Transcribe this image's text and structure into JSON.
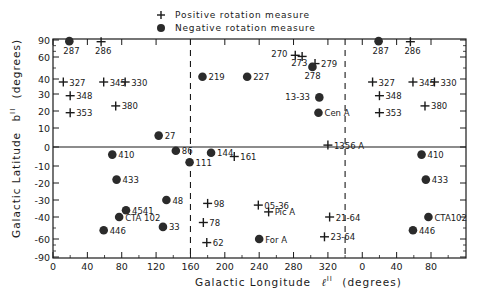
{
  "chart_data": {
    "type": "scatter",
    "title": "",
    "xlabel": "Galactic Longitude ℓII (degrees)",
    "ylabel": "Galactic Latitude bII (degrees)",
    "x_tick_labels": [
      "0",
      "40",
      "80",
      "120",
      "160",
      "200",
      "240",
      "280",
      "320",
      "0",
      "40",
      "80"
    ],
    "x_tick_values_unwrapped": [
      0,
      40,
      80,
      120,
      160,
      200,
      240,
      280,
      320,
      360,
      400,
      440
    ],
    "y_tick_labels": [
      "90",
      "60",
      "40",
      "30",
      "20",
      "10",
      "0",
      "-10",
      "-20",
      "-30",
      "-40",
      "-60",
      "-90"
    ],
    "y_tick_values": [
      90,
      60,
      40,
      30,
      20,
      10,
      0,
      -10,
      -20,
      -30,
      -40,
      -60,
      -90
    ],
    "xlim_unwrapped": [
      0,
      480
    ],
    "ylim": [
      -90,
      90
    ],
    "grid": false,
    "reference_lines": {
      "horizontal": [
        0
      ],
      "vertical_dashed": [
        160,
        340
      ]
    },
    "legend": {
      "position": "top-center",
      "entries": [
        {
          "marker": "plus",
          "label": "Positive rotation measure"
        },
        {
          "marker": "filled-circle",
          "label": "Negative rotation measure"
        }
      ]
    },
    "series": [
      {
        "name": "Positive rotation measure",
        "marker": "plus",
        "points": [
          {
            "label": "286",
            "l": 56,
            "b": 87
          },
          {
            "label": "327",
            "l": 12,
            "b": 38
          },
          {
            "label": "345",
            "l": 59,
            "b": 38
          },
          {
            "label": "330",
            "l": 84,
            "b": 38
          },
          {
            "label": "348",
            "l": 20,
            "b": 29
          },
          {
            "label": "380",
            "l": 73,
            "b": 23
          },
          {
            "label": "353",
            "l": 20,
            "b": 19
          },
          {
            "label": "270",
            "l": 282,
            "b": 63
          },
          {
            "label": "273",
            "l": 290,
            "b": 61
          },
          {
            "label": "279",
            "l": 305,
            "b": 54
          },
          {
            "label": "1356 A",
            "l": 320,
            "b": 1
          },
          {
            "label": "161",
            "l": 211,
            "b": -5
          },
          {
            "label": "98",
            "l": 180,
            "b": -32
          },
          {
            "label": "78",
            "l": 175,
            "b": -45
          },
          {
            "label": "62",
            "l": 179,
            "b": -66
          },
          {
            "label": "05-36",
            "l": 239,
            "b": -33
          },
          {
            "label": "Pic A",
            "l": 251,
            "b": -37
          },
          {
            "label": "21-64",
            "l": 322,
            "b": -40
          },
          {
            "label": "23-64",
            "l": 316,
            "b": -58
          },
          {
            "label": "327",
            "l": 372,
            "b": 38
          },
          {
            "label": "345",
            "l": 419,
            "b": 38
          },
          {
            "label": "330",
            "l": 444,
            "b": 38
          },
          {
            "label": "348",
            "l": 380,
            "b": 29
          },
          {
            "label": "380",
            "l": 433,
            "b": 23
          },
          {
            "label": "353",
            "l": 380,
            "b": 19
          },
          {
            "label": "286",
            "l": 416,
            "b": 87
          }
        ]
      },
      {
        "name": "Negative rotation measure",
        "marker": "filled-circle",
        "points": [
          {
            "label": "287",
            "l": 19,
            "b": 88
          },
          {
            "label": "219",
            "l": 174,
            "b": 42
          },
          {
            "label": "227",
            "l": 226,
            "b": 42
          },
          {
            "label": "278",
            "l": 302,
            "b": 51
          },
          {
            "label": "13-33",
            "l": 310,
            "b": 28
          },
          {
            "label": "Cen A",
            "l": 309,
            "b": 19
          },
          {
            "label": "27",
            "l": 123,
            "b": 6
          },
          {
            "label": "86",
            "l": 143,
            "b": -2
          },
          {
            "label": "111",
            "l": 159,
            "b": -8
          },
          {
            "label": "144",
            "l": 184,
            "b": -3
          },
          {
            "label": "410",
            "l": 69,
            "b": -4
          },
          {
            "label": "433",
            "l": 74,
            "b": -18
          },
          {
            "label": "48",
            "l": 132,
            "b": -30
          },
          {
            "label": "4541",
            "l": 85,
            "b": -36
          },
          {
            "label": "CTA 102",
            "l": 77,
            "b": -40
          },
          {
            "label": "446",
            "l": 59,
            "b": -52
          },
          {
            "label": "33",
            "l": 128,
            "b": -49
          },
          {
            "label": "For A",
            "l": 240,
            "b": -60
          },
          {
            "label": "287",
            "l": 379,
            "b": 88
          },
          {
            "label": "410",
            "l": 429,
            "b": -4
          },
          {
            "label": "433",
            "l": 434,
            "b": -18
          },
          {
            "label": "CTA102",
            "l": 437,
            "b": -40
          },
          {
            "label": "446",
            "l": 419,
            "b": -52
          }
        ]
      }
    ]
  },
  "legend": {
    "positive_label": "Positive rotation measure",
    "negative_label": "Negative rotation measure"
  },
  "axes": {
    "x_title": "Galactic Longitude",
    "x_symbol": "ℓ",
    "x_sup": "II",
    "x_unit": "(degrees)",
    "y_title": "Galactic Latitude",
    "y_symbol": "b",
    "y_sup": "II",
    "y_unit": "(degrees)"
  },
  "style": {
    "ink": "#1a1a1a",
    "marker_fill": "#2b2b2b",
    "background": "#ffffff"
  }
}
